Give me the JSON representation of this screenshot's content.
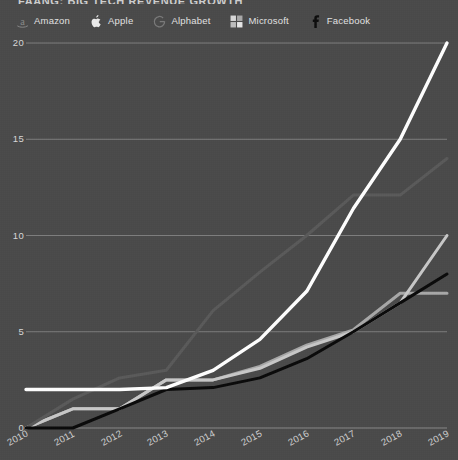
{
  "title": "FAANG: BIG TECH REVENUE GROWTH",
  "legend": {
    "position": "top",
    "items": [
      {
        "label": "Amazon",
        "icon": "amazon-a-icon",
        "color": "#f5f5f5"
      },
      {
        "label": "Apple",
        "icon": "apple-logo-icon",
        "color": "#e8e8e8"
      },
      {
        "label": "Alphabet",
        "icon": "google-g-icon",
        "color": "#6e6e6e"
      },
      {
        "label": "Microsoft",
        "icon": "microsoft-squares-icon",
        "color": "#c9c9c9"
      },
      {
        "label": "Facebook",
        "icon": "facebook-f-icon",
        "color": "#111111"
      }
    ]
  },
  "colors": {
    "background": "#4a4a4a",
    "gridline": "#9d9d9d",
    "amazon": "#ffffff",
    "apple": "#c8c8c8",
    "alphabet": "#5a5a5a",
    "microsoft": "#a8a8a8",
    "facebook": "#0a0a0a"
  },
  "chart_data": {
    "type": "line",
    "title": "FAANG: BIG TECH REVENUE GROWTH",
    "xlabel": "",
    "ylabel": "",
    "x": [
      2010,
      2011,
      2012,
      2013,
      2014,
      2015,
      2016,
      2017,
      2018,
      2019
    ],
    "categories": [
      "2010",
      "2011",
      "2012",
      "2013",
      "2014",
      "2015",
      "2016",
      "2017",
      "2018",
      "2019"
    ],
    "xlim": [
      2010,
      2019
    ],
    "ylim": [
      0,
      20
    ],
    "yticks": [
      0,
      5,
      10,
      15,
      20
    ],
    "xticks": [
      "2010",
      "2011",
      "2012",
      "2013",
      "2014",
      "2015",
      "2016",
      "2017",
      "2018",
      "2019"
    ],
    "grid": "horizontal",
    "legend_position": "top",
    "series": [
      {
        "name": "Amazon",
        "color": "#ffffff",
        "values": [
          2.0,
          2.0,
          2.0,
          2.1,
          3.0,
          4.6,
          7.1,
          11.4,
          15.0,
          20.0
        ]
      },
      {
        "name": "Apple",
        "color": "#c8c8c8",
        "values": [
          0.0,
          1.0,
          1.0,
          2.5,
          2.5,
          3.1,
          4.2,
          5.0,
          6.5,
          10.0
        ]
      },
      {
        "name": "Alphabet",
        "color": "#5a5a5a",
        "values": [
          0.0,
          1.5,
          2.6,
          3.0,
          6.1,
          8.1,
          10.0,
          12.1,
          12.1,
          14.0
        ]
      },
      {
        "name": "Microsoft",
        "color": "#a8a8a8",
        "values": [
          0.0,
          1.0,
          1.0,
          2.5,
          2.5,
          3.2,
          4.3,
          5.1,
          7.0,
          7.0
        ]
      },
      {
        "name": "Facebook",
        "color": "#0a0a0a",
        "values": [
          0.0,
          0.0,
          1.0,
          2.0,
          2.1,
          2.6,
          3.6,
          5.0,
          6.5,
          8.0
        ]
      }
    ]
  }
}
